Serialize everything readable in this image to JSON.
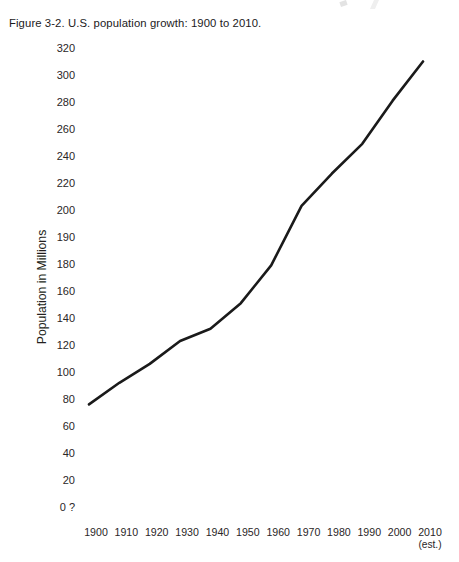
{
  "figure": {
    "caption": "Figure 3-2.  U.S. population growth: 1900 to 2010."
  },
  "chart_data": {
    "type": "line",
    "title": "Figure 3-2.  U.S. population growth: 1900 to 2010.",
    "xlabel": "",
    "ylabel": "Population in Millions",
    "grid": false,
    "legend": "none",
    "categories": [
      "1900",
      "1910",
      "1920",
      "1930",
      "1940",
      "1950",
      "1960",
      "1970",
      "1980",
      "1990",
      "2000",
      "2010"
    ],
    "x_tick_labels": [
      {
        "label": "1900",
        "sub": ""
      },
      {
        "label": "1910",
        "sub": ""
      },
      {
        "label": "1920",
        "sub": ""
      },
      {
        "label": "1930",
        "sub": ""
      },
      {
        "label": "1940",
        "sub": ""
      },
      {
        "label": "1950",
        "sub": ""
      },
      {
        "label": "1960",
        "sub": ""
      },
      {
        "label": "1970",
        "sub": ""
      },
      {
        "label": "1980",
        "sub": ""
      },
      {
        "label": "1990",
        "sub": ""
      },
      {
        "label": "2000",
        "sub": ""
      },
      {
        "label": "2010",
        "sub": "(est.)"
      }
    ],
    "y_tick_labels": [
      "320",
      "300",
      "280",
      "260",
      "240",
      "220",
      "200",
      "190",
      "180",
      "160",
      "140",
      "120",
      "100",
      "80",
      "60",
      "40",
      "20",
      "0 ?"
    ],
    "y_axis_note": "Tick labels are drawn at equal vertical spacing even though the printed value sequence is irregular (200, 190, 180, 160); the lowest label reads '0 ?' in the original scan.",
    "values": [
      76,
      92,
      106,
      123,
      132,
      151,
      179,
      203,
      227,
      249,
      281,
      310
    ],
    "series": [
      {
        "name": "U.S. population",
        "values": [
          76,
          92,
          106,
          123,
          132,
          151,
          179,
          203,
          227,
          249,
          281,
          310
        ]
      }
    ],
    "units": "millions",
    "line_color": "#1a1a1a"
  }
}
